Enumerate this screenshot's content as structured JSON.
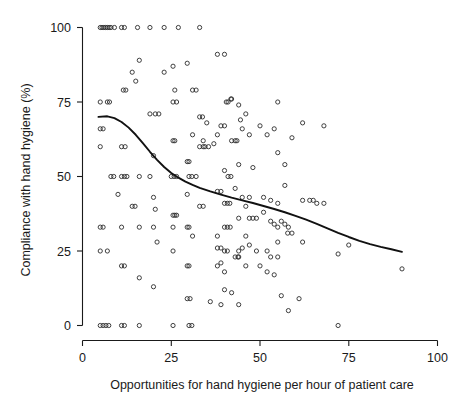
{
  "chart_data": {
    "type": "scatter",
    "title": "",
    "xlabel": "Opportunities for hand hygiene per hour of patient care",
    "ylabel": "Compliance with hand hygiene (%)",
    "xlim": [
      0,
      100
    ],
    "ylim": [
      0,
      100
    ],
    "xticks": [
      0,
      25,
      50,
      75,
      100
    ],
    "yticks": [
      0,
      25,
      50,
      75,
      100
    ],
    "xtick_labels": [
      "0",
      "25",
      "50",
      "75",
      "100"
    ],
    "ytick_labels": [
      "0",
      "25",
      "50",
      "75",
      "100"
    ],
    "grid": false,
    "legend": null,
    "marker": "open-circle",
    "marker_color": "#2b2b2b",
    "series": [
      {
        "name": "Hand hygiene observations",
        "points": [
          [
            5,
            100
          ],
          [
            5.5,
            100
          ],
          [
            6,
            100
          ],
          [
            6.5,
            100
          ],
          [
            7,
            100
          ],
          [
            7.5,
            100
          ],
          [
            8,
            100
          ],
          [
            9,
            100
          ],
          [
            11,
            100
          ],
          [
            11.8,
            100
          ],
          [
            15.5,
            100
          ],
          [
            19,
            100
          ],
          [
            23,
            100
          ],
          [
            27,
            100
          ],
          [
            33,
            100
          ],
          [
            5,
            75
          ],
          [
            7,
            75
          ],
          [
            7.6,
            75
          ],
          [
            11.5,
            79
          ],
          [
            12.2,
            79
          ],
          [
            14,
            85
          ],
          [
            15,
            82
          ],
          [
            16,
            89
          ],
          [
            20.5,
            71
          ],
          [
            21.5,
            71
          ],
          [
            23,
            85
          ],
          [
            25.5,
            87
          ],
          [
            26,
            79
          ],
          [
            25.5,
            75
          ],
          [
            26.5,
            75
          ],
          [
            29.5,
            88
          ],
          [
            31,
            79
          ],
          [
            32,
            79
          ],
          [
            33,
            70
          ],
          [
            33.8,
            70
          ],
          [
            35,
            68
          ],
          [
            34,
            62
          ],
          [
            31,
            64
          ],
          [
            38,
            91
          ],
          [
            40,
            91
          ],
          [
            40.5,
            75
          ],
          [
            41,
            75
          ],
          [
            41.8,
            76
          ],
          [
            42,
            76
          ],
          [
            44,
            74
          ],
          [
            44.5,
            69
          ],
          [
            46,
            71
          ],
          [
            55,
            75
          ],
          [
            5,
            66
          ],
          [
            5.8,
            66
          ],
          [
            5,
            60
          ],
          [
            11,
            60
          ],
          [
            12,
            60
          ],
          [
            19,
            71
          ],
          [
            20,
            57
          ],
          [
            25.5,
            62
          ],
          [
            26,
            62
          ],
          [
            29.5,
            55
          ],
          [
            30,
            55
          ],
          [
            33,
            60
          ],
          [
            34,
            60
          ],
          [
            34.5,
            60
          ],
          [
            35.5,
            60
          ],
          [
            37,
            61
          ],
          [
            38,
            64
          ],
          [
            39,
            67
          ],
          [
            40,
            67
          ],
          [
            42,
            62
          ],
          [
            43,
            62
          ],
          [
            43.5,
            62
          ],
          [
            44,
            54
          ],
          [
            45,
            66
          ],
          [
            47,
            64
          ],
          [
            48,
            53
          ],
          [
            50,
            67
          ],
          [
            52,
            64
          ],
          [
            54,
            66
          ],
          [
            55,
            58
          ],
          [
            57,
            54
          ],
          [
            59,
            63
          ],
          [
            62,
            68
          ],
          [
            68,
            67
          ],
          [
            8,
            50
          ],
          [
            8.8,
            50
          ],
          [
            11,
            50
          ],
          [
            11.8,
            50
          ],
          [
            12.5,
            50
          ],
          [
            16,
            50
          ],
          [
            19,
            50
          ],
          [
            25,
            50
          ],
          [
            25.8,
            50
          ],
          [
            26.5,
            50
          ],
          [
            30,
            50
          ],
          [
            30.8,
            50
          ],
          [
            32,
            50
          ],
          [
            40,
            52
          ],
          [
            41,
            50
          ],
          [
            41.8,
            50
          ],
          [
            43,
            46
          ],
          [
            45,
            43
          ],
          [
            47,
            43
          ],
          [
            48,
            36
          ],
          [
            51,
            43
          ],
          [
            53,
            42
          ],
          [
            55,
            41
          ],
          [
            57,
            47
          ],
          [
            62,
            42
          ],
          [
            64,
            42
          ],
          [
            65,
            42
          ],
          [
            66,
            41
          ],
          [
            68,
            41
          ],
          [
            10,
            44
          ],
          [
            14,
            40
          ],
          [
            14.8,
            40
          ],
          [
            20,
            43
          ],
          [
            20.5,
            39
          ],
          [
            25.5,
            37
          ],
          [
            26,
            37
          ],
          [
            26.5,
            37
          ],
          [
            29.5,
            44
          ],
          [
            33,
            40
          ],
          [
            34,
            40
          ],
          [
            38,
            45
          ],
          [
            39,
            45
          ],
          [
            40,
            41
          ],
          [
            40.8,
            41
          ],
          [
            41.5,
            41
          ],
          [
            44,
            36
          ],
          [
            46,
            40
          ],
          [
            47,
            36
          ],
          [
            49,
            36
          ],
          [
            51,
            38
          ],
          [
            53,
            35
          ],
          [
            54,
            34
          ],
          [
            55,
            33
          ],
          [
            56,
            35
          ],
          [
            57,
            34
          ],
          [
            57.8,
            31
          ],
          [
            5,
            33
          ],
          [
            5.8,
            33
          ],
          [
            11,
            33
          ],
          [
            16,
            33
          ],
          [
            20,
            33
          ],
          [
            21,
            28
          ],
          [
            25.5,
            33
          ],
          [
            29.5,
            33
          ],
          [
            30,
            33
          ],
          [
            31,
            30
          ],
          [
            38,
            30
          ],
          [
            40,
            33
          ],
          [
            40.8,
            33
          ],
          [
            41.6,
            33
          ],
          [
            44,
            25
          ],
          [
            45,
            26
          ],
          [
            46,
            30
          ],
          [
            47,
            27
          ],
          [
            38,
            26
          ],
          [
            39,
            26
          ],
          [
            40,
            25
          ],
          [
            40.8,
            25
          ],
          [
            43,
            23
          ],
          [
            43.8,
            23
          ],
          [
            49,
            25
          ],
          [
            52,
            25
          ],
          [
            53,
            23
          ],
          [
            55,
            28
          ],
          [
            58,
            33
          ],
          [
            59,
            31
          ],
          [
            62,
            28
          ],
          [
            72,
            24
          ],
          [
            75,
            27
          ],
          [
            90,
            19
          ],
          [
            5,
            25
          ],
          [
            7,
            25
          ],
          [
            11,
            20
          ],
          [
            11.8,
            20
          ],
          [
            16,
            16
          ],
          [
            20,
            13
          ],
          [
            25.5,
            25
          ],
          [
            29.5,
            20
          ],
          [
            30,
            20
          ],
          [
            38,
            20
          ],
          [
            39,
            21
          ],
          [
            40,
            18
          ],
          [
            44,
            23
          ],
          [
            46,
            20
          ],
          [
            50,
            20
          ],
          [
            52,
            18
          ],
          [
            54,
            17
          ],
          [
            55,
            23
          ],
          [
            40,
            12
          ],
          [
            42,
            11
          ],
          [
            44,
            7
          ],
          [
            29.5,
            9
          ],
          [
            30.3,
            9
          ],
          [
            36,
            8
          ],
          [
            39,
            7
          ],
          [
            56,
            10
          ],
          [
            58,
            5
          ],
          [
            61,
            9
          ],
          [
            5,
            0
          ],
          [
            5.8,
            0
          ],
          [
            6.6,
            0
          ],
          [
            7.4,
            0
          ],
          [
            11,
            0
          ],
          [
            11.8,
            0
          ],
          [
            16,
            0
          ],
          [
            25.5,
            0
          ],
          [
            30,
            0
          ],
          [
            30.8,
            0
          ],
          [
            72,
            0
          ]
        ]
      }
    ],
    "trendline": {
      "name": "LOESS smoother",
      "color": "#111111",
      "points": [
        [
          4.5,
          70.0
        ],
        [
          7,
          70.2
        ],
        [
          9,
          69.6
        ],
        [
          11,
          68.3
        ],
        [
          13,
          66.4
        ],
        [
          15,
          64.0
        ],
        [
          17,
          61.2
        ],
        [
          19,
          58.3
        ],
        [
          21,
          55.6
        ],
        [
          23,
          53.2
        ],
        [
          25,
          51.2
        ],
        [
          27,
          49.6
        ],
        [
          29,
          48.3
        ],
        [
          31,
          47.2
        ],
        [
          33,
          46.2
        ],
        [
          36,
          45.0
        ],
        [
          39,
          43.9
        ],
        [
          42,
          42.9
        ],
        [
          45,
          42.0
        ],
        [
          48,
          41.1
        ],
        [
          51,
          40.1
        ],
        [
          54,
          39.1
        ],
        [
          57,
          38.0
        ],
        [
          60,
          36.8
        ],
        [
          63,
          35.5
        ],
        [
          66,
          34.1
        ],
        [
          69,
          32.6
        ],
        [
          72,
          31.1
        ],
        [
          75,
          29.7
        ],
        [
          78,
          28.4
        ],
        [
          81,
          27.3
        ],
        [
          84,
          26.4
        ],
        [
          87,
          25.6
        ],
        [
          90,
          24.7
        ]
      ]
    }
  },
  "axes": {
    "x_title": "Opportunities for hand hygiene per hour of patient care",
    "y_title": "Compliance with hand hygiene (%)",
    "x_tick_0": "0",
    "x_tick_1": "25",
    "x_tick_2": "50",
    "x_tick_3": "75",
    "x_tick_4": "100",
    "y_tick_0": "0",
    "y_tick_1": "25",
    "y_tick_2": "50",
    "y_tick_3": "75",
    "y_tick_4": "100"
  }
}
